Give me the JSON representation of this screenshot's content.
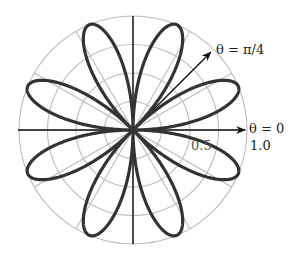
{
  "chart_data": {
    "type": "line",
    "subtype": "polar",
    "title": "",
    "equation": "r = sin(4θ)",
    "petals": 8,
    "petal_center_angles_deg": [
      22.5,
      67.5,
      112.5,
      157.5,
      202.5,
      247.5,
      292.5,
      337.5
    ],
    "r_max": 1.0,
    "radial_grid": [
      0.25,
      0.5,
      0.75,
      1.0
    ],
    "angular_grid_deg": [
      0,
      30,
      60,
      90,
      120,
      150,
      180,
      210,
      240,
      270,
      300,
      330
    ],
    "radial_tick_labels": [
      "0.5",
      "1.0"
    ],
    "annotations": [
      {
        "text": "θ = 0",
        "angle_deg": 0,
        "type": "arrow"
      },
      {
        "text": "θ = π/4",
        "angle_deg": 45,
        "type": "arrow"
      }
    ],
    "grid": true,
    "colors": {
      "curve": "#333333",
      "grid": "#bbbbbb",
      "axis": "#111111"
    }
  },
  "labels": {
    "theta0": "θ = 0",
    "thetaPi4": "θ = π/4",
    "tick05": "0.5",
    "tick10": "1.0"
  }
}
